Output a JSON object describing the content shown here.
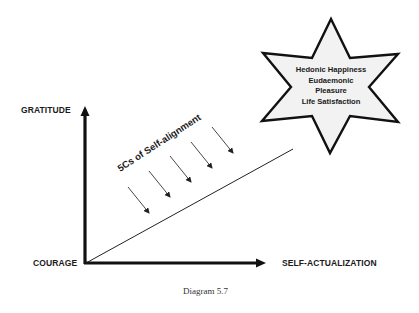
{
  "diagram": {
    "axes": {
      "y_axis_label": "GRATITUDE",
      "origin_label": "COURAGE",
      "x_axis_label": "SELF-ACTUALIZATION"
    },
    "diagonal_label": "5Cs of Self-alignment",
    "arrow_count": 5,
    "star": {
      "lines": [
        "Hedonic Happiness",
        "Eudaemonic",
        "Pleasure",
        "Life Satisfaction"
      ],
      "fill": "#f2f2f2",
      "stroke": "#111111"
    },
    "caption": "Diagram 5.7"
  }
}
